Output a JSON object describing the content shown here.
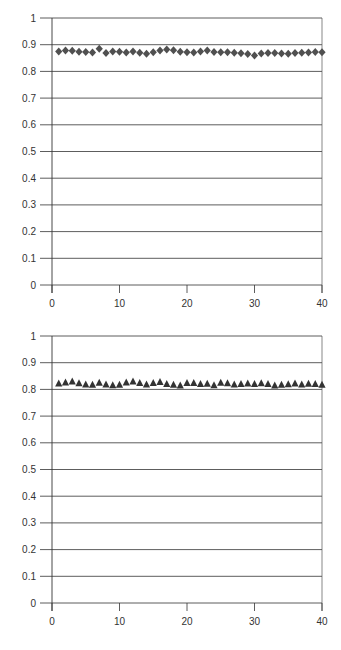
{
  "chart_data": [
    {
      "type": "scatter",
      "title": "",
      "xlabel": "",
      "ylabel": "",
      "marker": "diamond",
      "marker_color": "#505050",
      "xlim": [
        0,
        40
      ],
      "ylim": [
        0,
        1
      ],
      "x_ticks": [
        0,
        10,
        20,
        30,
        40
      ],
      "y_ticks": [
        0,
        0.1,
        0.2,
        0.3,
        0.4,
        0.5,
        0.6,
        0.7,
        0.8,
        0.9,
        1
      ],
      "grid": "horizontal",
      "legend": "none",
      "series": [
        {
          "name": "series-1",
          "x": [
            1,
            2,
            3,
            4,
            5,
            6,
            7,
            8,
            9,
            10,
            11,
            12,
            13,
            14,
            15,
            16,
            17,
            18,
            19,
            20,
            21,
            22,
            23,
            24,
            25,
            26,
            27,
            28,
            29,
            30,
            31,
            32,
            33,
            34,
            35,
            36,
            37,
            38,
            39,
            40
          ],
          "values": [
            0.875,
            0.878,
            0.877,
            0.874,
            0.873,
            0.871,
            0.885,
            0.869,
            0.875,
            0.874,
            0.871,
            0.875,
            0.87,
            0.866,
            0.872,
            0.878,
            0.882,
            0.879,
            0.874,
            0.872,
            0.871,
            0.875,
            0.878,
            0.873,
            0.872,
            0.872,
            0.87,
            0.868,
            0.865,
            0.86,
            0.867,
            0.869,
            0.869,
            0.867,
            0.866,
            0.869,
            0.87,
            0.871,
            0.873,
            0.872
          ]
        }
      ]
    },
    {
      "type": "scatter",
      "title": "",
      "xlabel": "",
      "ylabel": "",
      "marker": "triangle",
      "marker_color": "#333333",
      "xlim": [
        0,
        40
      ],
      "ylim": [
        0,
        1
      ],
      "x_ticks": [
        0,
        10,
        20,
        30,
        40
      ],
      "y_ticks": [
        0,
        0.1,
        0.2,
        0.3,
        0.4,
        0.5,
        0.6,
        0.7,
        0.8,
        0.9,
        1
      ],
      "grid": "horizontal",
      "legend": "none",
      "series": [
        {
          "name": "series-1",
          "x": [
            1,
            2,
            3,
            4,
            5,
            6,
            7,
            8,
            9,
            10,
            11,
            12,
            13,
            14,
            15,
            16,
            17,
            18,
            19,
            20,
            21,
            22,
            23,
            24,
            25,
            26,
            27,
            28,
            29,
            30,
            31,
            32,
            33,
            34,
            35,
            36,
            37,
            38,
            39,
            40
          ],
          "values": [
            0.822,
            0.826,
            0.83,
            0.823,
            0.818,
            0.817,
            0.825,
            0.818,
            0.816,
            0.817,
            0.826,
            0.83,
            0.824,
            0.818,
            0.824,
            0.828,
            0.82,
            0.817,
            0.815,
            0.824,
            0.824,
            0.82,
            0.821,
            0.816,
            0.825,
            0.823,
            0.818,
            0.82,
            0.822,
            0.82,
            0.823,
            0.82,
            0.815,
            0.817,
            0.819,
            0.822,
            0.818,
            0.821,
            0.82,
            0.817
          ]
        }
      ]
    }
  ],
  "charts": [
    {
      "y_tick_labels": [
        "0",
        "0.1",
        "0.2",
        "0.3",
        "0.4",
        "0.5",
        "0.6",
        "0.7",
        "0.8",
        "0.9",
        "1"
      ],
      "x_tick_labels": [
        "0",
        "10",
        "20",
        "30",
        "40"
      ]
    },
    {
      "y_tick_labels": [
        "0",
        "0.1",
        "0.2",
        "0.3",
        "0.4",
        "0.5",
        "0.6",
        "0.7",
        "0.8",
        "0.9",
        "1"
      ],
      "x_tick_labels": [
        "0",
        "10",
        "20",
        "30",
        "40"
      ]
    }
  ]
}
